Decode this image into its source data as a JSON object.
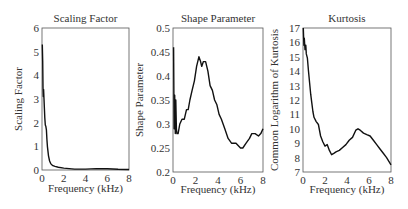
{
  "figure": {
    "panels": [
      {
        "title": "Scaling Factor",
        "ylabel": "Scaling Factor",
        "xlabel": "Frequency (kHz)"
      },
      {
        "title": "Shape Parameter",
        "ylabel": "Shape Parameter",
        "xlabel": "Frequency (kHz)"
      },
      {
        "title": "Kurtosis",
        "ylabel": "Common Logarithm of Kurtosis",
        "xlabel": "Frequency (kHz)"
      }
    ]
  },
  "chart_data": [
    {
      "type": "line",
      "title": "Scaling Factor",
      "xlabel": "Frequency (kHz)",
      "ylabel": "Scaling Factor",
      "xlim": [
        0,
        8
      ],
      "ylim": [
        0,
        6
      ],
      "xticks": [
        0,
        2,
        4,
        6,
        8
      ],
      "yticks": [
        0,
        1,
        2,
        3,
        4,
        5,
        6
      ],
      "grid": false,
      "frame": {
        "x": 42,
        "y": 28,
        "w": 87,
        "h": 142
      },
      "series": [
        {
          "name": "Scaling Factor",
          "x": [
            0.03,
            0.06,
            0.09,
            0.12,
            0.15,
            0.18,
            0.22,
            0.26,
            0.3,
            0.35,
            0.4,
            0.45,
            0.5,
            0.6,
            0.7,
            0.8,
            0.9,
            1.0,
            1.2,
            1.5,
            2.0,
            2.5,
            3.0,
            4.0,
            5.0,
            6.0,
            7.0,
            8.0
          ],
          "y": [
            5.3,
            4.6,
            3.5,
            3.1,
            3.4,
            3.0,
            2.6,
            2.2,
            1.9,
            1.85,
            1.7,
            1.3,
            1.0,
            0.6,
            0.38,
            0.27,
            0.22,
            0.18,
            0.15,
            0.12,
            0.08,
            0.06,
            0.04,
            0.04,
            0.06,
            0.05,
            0.03,
            0.02
          ]
        }
      ]
    },
    {
      "type": "line",
      "title": "Shape Parameter",
      "xlabel": "Frequency (kHz)",
      "ylabel": "Shape Parameter",
      "xlim": [
        0,
        8
      ],
      "ylim": [
        0.2,
        0.5
      ],
      "xticks": [
        0,
        2,
        4,
        6,
        8
      ],
      "yticks": [
        0.2,
        0.25,
        0.3,
        0.35,
        0.4,
        0.45,
        0.5
      ],
      "ytick_labels": [
        "0.2",
        "0.25",
        "0.3",
        "0.35",
        "0.4",
        "0.45",
        "0.5"
      ],
      "grid": false,
      "frame": {
        "x": 173,
        "y": 28,
        "w": 90,
        "h": 144
      },
      "series": [
        {
          "name": "Shape Parameter",
          "x": [
            0.05,
            0.1,
            0.15,
            0.2,
            0.25,
            0.3,
            0.35,
            0.45,
            0.6,
            0.8,
            1.0,
            1.2,
            1.35,
            1.5,
            1.7,
            1.9,
            2.1,
            2.3,
            2.45,
            2.55,
            2.7,
            2.9,
            3.1,
            3.3,
            3.5,
            3.7,
            3.9,
            4.1,
            4.3,
            4.6,
            4.9,
            5.2,
            5.6,
            6.0,
            6.2,
            6.5,
            6.8,
            7.0,
            7.3,
            7.6,
            7.8,
            8.0
          ],
          "y": [
            0.46,
            0.29,
            0.36,
            0.28,
            0.35,
            0.29,
            0.28,
            0.28,
            0.3,
            0.31,
            0.31,
            0.33,
            0.33,
            0.35,
            0.37,
            0.39,
            0.42,
            0.44,
            0.43,
            0.42,
            0.43,
            0.43,
            0.41,
            0.38,
            0.37,
            0.35,
            0.34,
            0.32,
            0.31,
            0.29,
            0.27,
            0.26,
            0.26,
            0.25,
            0.25,
            0.26,
            0.27,
            0.28,
            0.28,
            0.275,
            0.28,
            0.29
          ]
        }
      ]
    },
    {
      "type": "line",
      "title": "Kurtosis",
      "xlabel": "Frequency (kHz)",
      "ylabel": "Common Logarithm of Kurtosis",
      "xlim": [
        0,
        8
      ],
      "ylim": [
        7,
        17
      ],
      "xticks": [
        0,
        2,
        4,
        6,
        8
      ],
      "yticks": [
        7,
        8,
        9,
        10,
        11,
        12,
        13,
        14,
        15,
        16,
        17
      ],
      "grid": false,
      "frame": {
        "x": 303,
        "y": 28,
        "w": 88,
        "h": 144
      },
      "series": [
        {
          "name": "Kurtosis",
          "x": [
            0.03,
            0.08,
            0.12,
            0.18,
            0.25,
            0.3,
            0.4,
            0.5,
            0.6,
            0.7,
            0.8,
            0.9,
            1.0,
            1.2,
            1.4,
            1.6,
            1.8,
            2.0,
            2.2,
            2.4,
            2.6,
            2.8,
            3.0,
            3.3,
            3.6,
            3.9,
            4.2,
            4.5,
            4.8,
            5.0,
            5.2,
            5.5,
            5.8,
            6.1,
            6.4,
            6.7,
            7.0,
            7.3,
            7.6,
            8.0
          ],
          "y": [
            17.0,
            15.8,
            16.3,
            15.5,
            15.8,
            15.2,
            14.9,
            14.0,
            13.2,
            12.4,
            11.8,
            11.2,
            10.8,
            10.5,
            10.3,
            9.5,
            9.1,
            8.8,
            8.9,
            8.5,
            8.2,
            8.3,
            8.4,
            8.5,
            8.7,
            8.9,
            9.2,
            9.4,
            9.9,
            10.0,
            9.9,
            9.7,
            9.6,
            9.5,
            9.2,
            8.9,
            8.6,
            8.3,
            8.0,
            7.5
          ]
        }
      ]
    }
  ]
}
